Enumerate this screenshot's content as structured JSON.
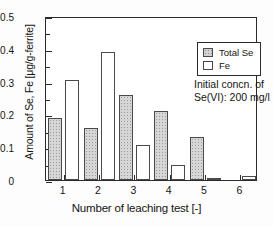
{
  "chart_data": {
    "type": "bar",
    "title": "",
    "xlabel": "Number of leaching test [-]",
    "ylabel": "Amount of Se, Fe [μg/g-ferrite]",
    "categories": [
      "1",
      "2",
      "3",
      "4",
      "5",
      "6"
    ],
    "series": [
      {
        "name": "Total Se",
        "values": [
          0.19,
          0.16,
          0.26,
          0.21,
          0.13,
          0.0
        ]
      },
      {
        "name": "Fe",
        "values": [
          0.305,
          0.39,
          0.107,
          0.045,
          0.007,
          0.012
        ]
      }
    ],
    "ylim": [
      0,
      0.5
    ],
    "yticks": [
      0,
      0.1,
      0.2,
      0.3,
      0.4,
      0.5
    ],
    "ytick_labels": [
      "0",
      "0.1",
      "0.2",
      "0.3",
      "0.4",
      "0.5"
    ],
    "grid": false,
    "legend": {
      "position": "top-right",
      "entries": [
        {
          "label": "Total Se",
          "swatch": "hatched-gray"
        },
        {
          "label": "Fe",
          "swatch": "white"
        }
      ]
    },
    "annotations": [
      {
        "line1": "Initial concn. of",
        "line2": "Se(VI): 200 mg/l"
      }
    ]
  },
  "colors": {
    "axis": "#2b2b2b",
    "bar_se_fill": "#d6d6d6",
    "bar_fe_fill": "#ffffff",
    "bar_edge": "#4a4a4a",
    "text": "#141414",
    "background": "#ffffff"
  }
}
